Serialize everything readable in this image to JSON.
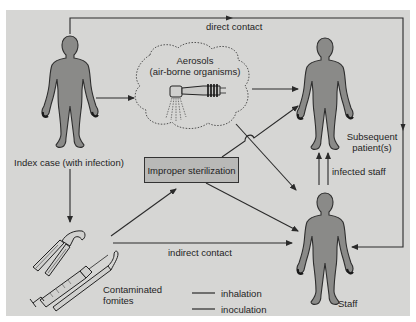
{
  "diagram": {
    "nodes": {
      "index_case": "Index case (with infection)",
      "aerosols_title": "Aerosols",
      "aerosols_subtitle": "(air-borne organisms)",
      "subsequent_patients_line1": "Subsequent",
      "subsequent_patients_line2": "patient(s)",
      "improper_sterilization": "Improper sterilization",
      "contaminated_fomites_line1": "Contaminated",
      "contaminated_fomites_line2": "fomites",
      "staff": "Staff"
    },
    "edges": {
      "direct_contact": "direct contact",
      "indirect_contact": "indirect contact",
      "infected_staff": "infected staff"
    },
    "legend": [
      {
        "label": "inhalation"
      },
      {
        "label": "inoculation"
      }
    ],
    "icons": {
      "person": "human-figure-icon",
      "handpiece": "dental-handpiece-icon",
      "forceps": "extraction-forceps-icon",
      "syringe": "syringe-icon",
      "probe": "dental-probe-icon"
    },
    "colors": {
      "background": "#d6d6d4",
      "figure_fill": "#8a8a88",
      "line": "#2a2a2a",
      "box_fill": "#b9b9b7"
    }
  }
}
